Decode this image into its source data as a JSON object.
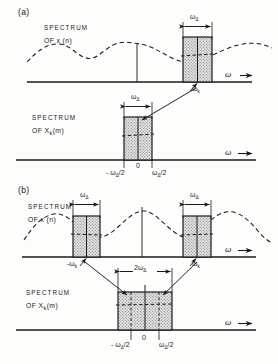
{
  "figure": {
    "type": "signal-processing-spectrum-diagram",
    "panels": [
      {
        "tag": "(a)",
        "subplots": [
          {
            "id": "a-top",
            "title_line1": "SPECTRUM",
            "title_line2": "OF  x (n)",
            "axis_label": "ω",
            "dimension_label_html": "ω<sub>Δ</sub>",
            "band_center_label_html": "ω<sub>k</sub>",
            "bands": 1,
            "envelope": "wavy-aperiodic"
          },
          {
            "id": "a-bottom",
            "title_line1": "SPECTRUM",
            "title_line2_html": "OF  X<sub>k</sub>(m)",
            "axis_label": "ω",
            "dimension_label_html": "ω<sub>Δ</sub>",
            "tick_left_html": "- ω<sub>Δ</sub>/2",
            "tick_zero": "0",
            "tick_right_html": "ω<sub>Δ</sub>/2",
            "bands": 1
          }
        ]
      },
      {
        "tag": "(b)",
        "subplots": [
          {
            "id": "b-top",
            "title_line1": "SPECTRUM",
            "title_line2": "OF  x (n)",
            "axis_label": "ω",
            "dimension_label_left_html": "ω<sub>Δ</sub>",
            "dimension_label_right_html": "ω<sub>Δ</sub>",
            "tick_left_html": "-ω<sub>k</sub>",
            "tick_right_html": "ω<sub>k</sub>",
            "bands": 2,
            "envelope": "raised-cosine-periodic"
          },
          {
            "id": "b-bottom",
            "title_line1": "SPECTRUM",
            "title_line2_html": "OF  X<sub>k</sub>(m)",
            "axis_label": "ω",
            "dimension_label_html": "2ω<sub>Δ</sub>",
            "tick_left_html": "- ω<sub>Δ</sub>/2",
            "tick_zero": "0",
            "tick_right_html": "ω<sub>Δ</sub>/2",
            "bands": 1
          }
        ]
      }
    ],
    "colors": {
      "ink": "#1a1a1a",
      "paper": "#fdfdfc",
      "band_fill": "#cfcfcf",
      "band_stroke": "#1a1a1a"
    }
  }
}
